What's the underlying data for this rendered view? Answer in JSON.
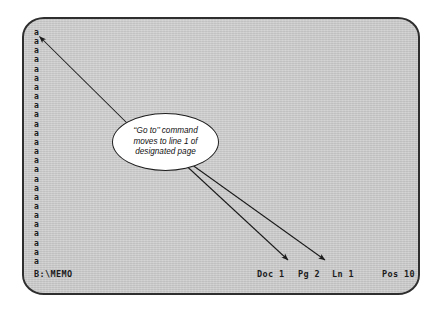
{
  "figure": {
    "kind": "annotated-screenshot",
    "colors": {
      "screen_background": "#c9c9c9",
      "bezel_border": "#2e2e2e",
      "text": "#1a1a1a",
      "callout_fill": "#ffffff",
      "callout_stroke": "#1f1f1f",
      "arrow": "#1b1b1b"
    }
  },
  "screen": {
    "document": {
      "line_char": "a",
      "line_count": 26,
      "lines": [
        "a",
        "a",
        "a",
        "a",
        "a",
        "a",
        "a",
        "a",
        "a",
        "a",
        "a",
        "a",
        "a",
        "a",
        "a",
        "a",
        "a",
        "a",
        "a",
        "a",
        "a",
        "a",
        "a",
        "a",
        "a",
        "a"
      ]
    },
    "status_bar": {
      "path": "B:\\MEMO",
      "doc": "Doc 1",
      "pg": "Pg 2",
      "ln": "Ln 1",
      "pos": "Pos 10"
    }
  },
  "callout": {
    "lines": [
      "‘‘Go to’’ command",
      "moves to line 1 of",
      "designated page"
    ],
    "full_text": "‘‘Go to’’ command moves to line 1 of designated page",
    "targets": [
      "document-first-line",
      "status-pg",
      "status-ln"
    ]
  },
  "arrows": [
    {
      "name": "arrow-to-first-line",
      "from": "callout",
      "to": "document first line 'a'"
    },
    {
      "name": "arrow-to-pg-indicator",
      "from": "callout",
      "to": "Pg 2"
    },
    {
      "name": "arrow-to-ln-indicator",
      "from": "callout",
      "to": "Ln 1"
    }
  ]
}
